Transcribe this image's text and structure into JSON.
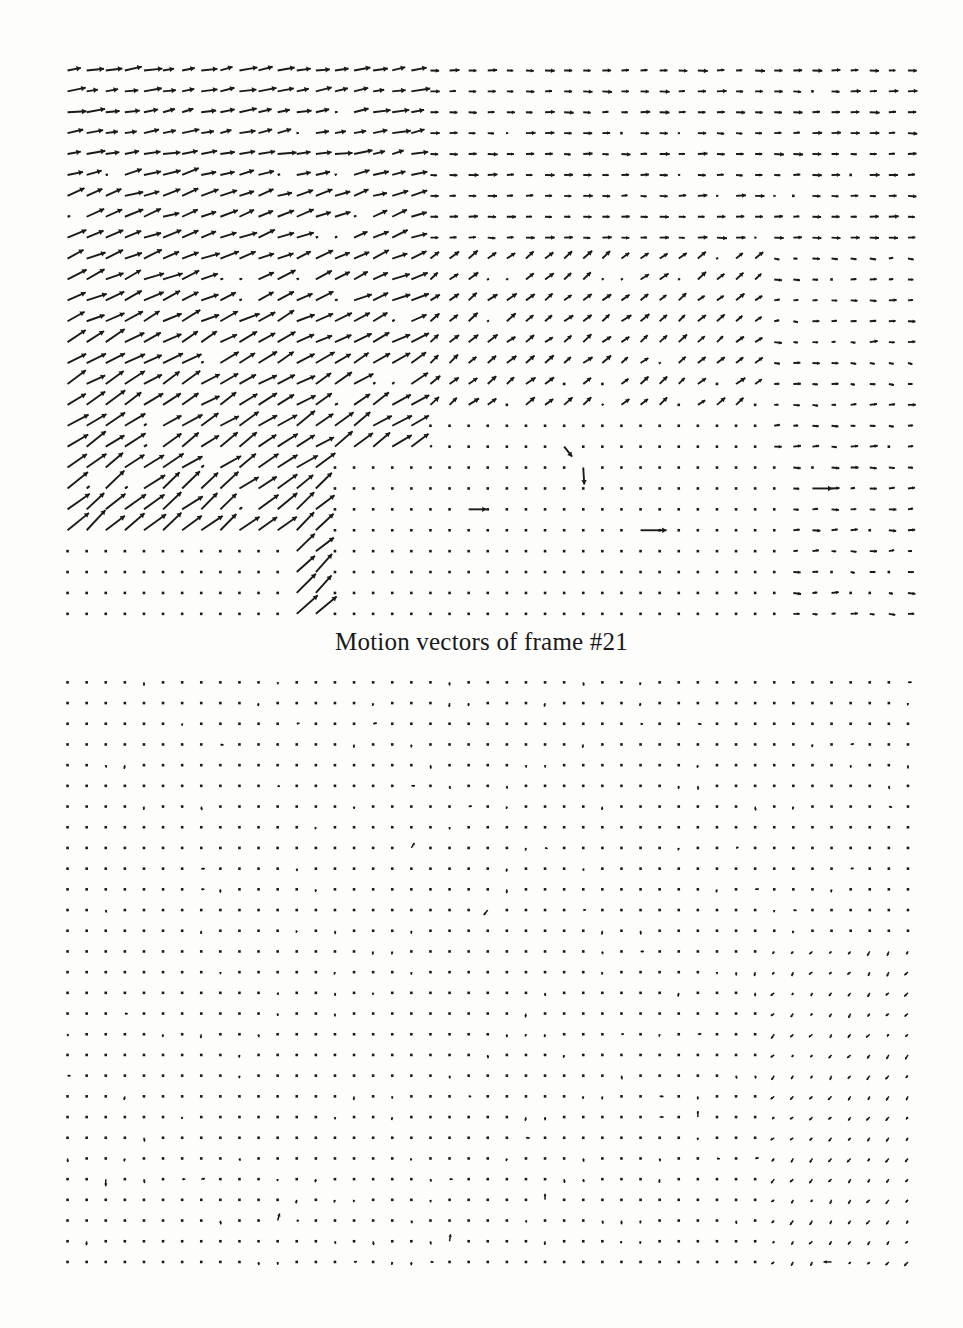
{
  "document": {
    "background_color": "#fdfdfc",
    "ink_color": "#1a1a1a"
  },
  "figures": [
    {
      "id": "frame-21",
      "caption": "Motion vectors of frame #21",
      "chart_data": {
        "type": "quiver",
        "title": "Motion vectors of frame #21",
        "xlabel": "",
        "ylabel": "",
        "grid": false,
        "legend": "none",
        "description": "Dense block motion vector field; large rightward and up-right motion across most of the frame, with a quiescent lower-right region of near-zero vectors.",
        "grid_cols": 45,
        "grid_rows": 27,
        "cell_width": 19.1,
        "cell_height": 20.9,
        "regions": [
          {
            "name": "upper-left-ramp",
            "x_range": [
              0,
              18
            ],
            "y_range": [
              0,
              9
            ],
            "mean_u": 16,
            "mean_v": -4,
            "magnitude": 17
          },
          {
            "name": "upper-right-uniform",
            "x_range": [
              19,
              44
            ],
            "y_range": [
              0,
              9
            ],
            "mean_u": 7,
            "mean_v": 0,
            "magnitude": 7
          },
          {
            "name": "mid-left-diagonal",
            "x_range": [
              0,
              16
            ],
            "y_range": [
              10,
              19
            ],
            "mean_u": 11,
            "mean_v": -9,
            "magnitude": 14
          },
          {
            "name": "mid-center-diagonal",
            "x_range": [
              17,
              32
            ],
            "y_range": [
              10,
              21
            ],
            "mean_u": 6,
            "mean_v": -6,
            "magnitude": 8
          },
          {
            "name": "lower-right-quiet",
            "x_range": [
              22,
              38
            ],
            "y_range": [
              20,
              26
            ],
            "mean_u": 0,
            "mean_v": 0,
            "magnitude": 0
          },
          {
            "name": "lower-right-cluster",
            "x_range": [
              38,
              44
            ],
            "y_range": [
              14,
              26
            ],
            "mean_u": 4,
            "mean_v": 0,
            "magnitude": 4
          },
          {
            "name": "bottom-left-cluster",
            "x_range": [
              10,
              20
            ],
            "y_range": [
              22,
              26
            ],
            "mean_u": 9,
            "mean_v": -8,
            "magnitude": 12
          }
        ]
      }
    },
    {
      "id": "frame-34",
      "caption": "Motion vectors of frame #34",
      "chart_data": {
        "type": "quiver",
        "title": "Motion vectors of frame #34",
        "xlabel": "",
        "ylabel": "",
        "grid": false,
        "legend": "none",
        "description": "Sparse block motion vector field; nearly all vectors are zero-length dots, with scattered very short ticks and a small number of down-left vectors near the right edge.",
        "grid_cols": 45,
        "grid_rows": 29,
        "cell_width": 19.1,
        "cell_height": 20.7,
        "regions": [
          {
            "name": "global-quiescent",
            "x_range": [
              0,
              44
            ],
            "y_range": [
              0,
              28
            ],
            "mean_u": 0,
            "mean_v": 0,
            "magnitude": 0
          },
          {
            "name": "right-edge-downleft",
            "x_range": [
              38,
              44
            ],
            "y_range": [
              14,
              28
            ],
            "mean_u": -2,
            "mean_v": 3,
            "magnitude": 3.6
          },
          {
            "name": "scattered-ticks",
            "x_range": [
              0,
              37
            ],
            "y_range": [
              0,
              28
            ],
            "mean_u": 0,
            "mean_v": 1,
            "magnitude": 1
          }
        ]
      }
    }
  ]
}
